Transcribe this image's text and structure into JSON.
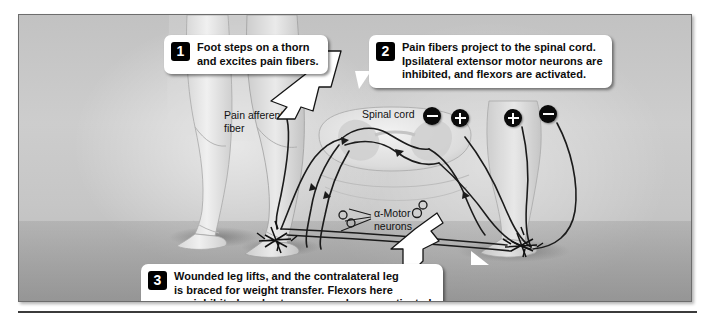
{
  "figure": {
    "background_color": "#c6c6c6",
    "border_color": "#6d6d6d"
  },
  "callouts": [
    {
      "number": "1",
      "text": "Foot steps on a thorn\nand excites pain fibers.",
      "name": "callout-step-1"
    },
    {
      "number": "2",
      "text": "Pain fibers project to the spinal cord.\nIpsilateral extensor motor neurons are\ninhibited, and flexors are activated.",
      "name": "callout-step-2"
    },
    {
      "number": "3",
      "text": "Wounded leg lifts, and the contralateral leg\nis braced for weight transfer. Flexors here\nare inhibited, and extensor muscles are activated.",
      "name": "callout-step-3"
    }
  ],
  "labels": {
    "pain_afferent": "Pain afferent\nfiber",
    "spinal_cord": "Spinal cord",
    "alpha_motor": "α-Motor\nneurons"
  },
  "signs": [
    {
      "symbol": "−",
      "name": "sign-minus-left-outer"
    },
    {
      "symbol": "+",
      "name": "sign-plus-left-inner"
    },
    {
      "symbol": "+",
      "name": "sign-plus-right-inner"
    },
    {
      "symbol": "−",
      "name": "sign-minus-right-outer"
    }
  ],
  "colors": {
    "badge_bg": "#000000",
    "badge_text": "#ffffff",
    "callout_bg": "#ffffff",
    "nerve_line": "#1b1b1b",
    "rule": "#3b3b3b"
  }
}
